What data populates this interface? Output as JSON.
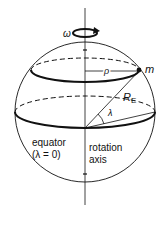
{
  "diagram": {
    "labels": {
      "omega": "ω",
      "rho": "ρ",
      "mass": "m",
      "radius": "R",
      "radius_sub": "E",
      "lambda": "λ",
      "equator": "equator",
      "equator_cond": "(λ = 0)",
      "axis_line1": "rotation",
      "axis_line2": "axis"
    },
    "colors": {
      "stroke": "#111111",
      "background": "#ffffff"
    }
  }
}
